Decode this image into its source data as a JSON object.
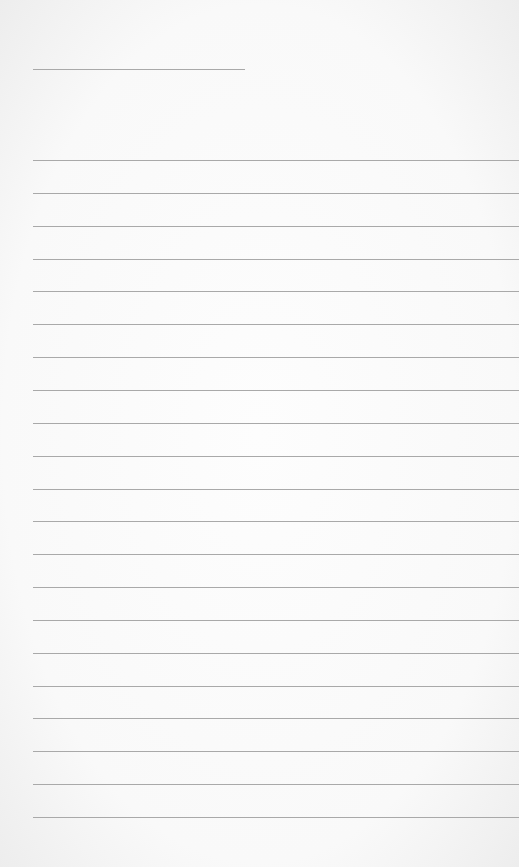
{
  "page": {
    "type": "blank lined paper",
    "colors": {
      "paper": "#fbfbfb",
      "rule": "#a9a9a9"
    }
  },
  "header_line": {
    "x": 33,
    "y": 69,
    "width": 212
  },
  "ruled_lines": {
    "x": 33,
    "first_y": 160,
    "spacing": 32.85,
    "count": 21,
    "width": 486
  }
}
